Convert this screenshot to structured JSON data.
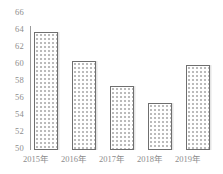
{
  "chart_data": {
    "type": "bar",
    "title": "",
    "subtitle": "",
    "xlabel": "",
    "ylabel": "",
    "categories": [
      "2015年",
      "2016年",
      "2017年",
      "2018年",
      "2019年"
    ],
    "values": [
      63.7,
      60.3,
      57.4,
      55.4,
      59.9
    ],
    "series": [
      {
        "name": "",
        "values": [
          63.7,
          60.3,
          57.4,
          55.4,
          59.9
        ]
      }
    ],
    "ylim": [
      50,
      66
    ],
    "yticks": [
      50,
      52,
      54,
      56,
      58,
      60,
      62,
      64,
      66
    ],
    "ytick_labels": [
      "50",
      "52",
      "54",
      "56",
      "58",
      "60",
      "62",
      "64",
      "66"
    ],
    "grid": false,
    "legend": false,
    "legend_position": "none",
    "bar_fill": "#ffffff",
    "bar_pattern": "dotted",
    "bar_border_color": "#6f6f6f",
    "axis_color": "#9a9a9a",
    "tick_label_color": "#8d8d8d",
    "annotations": []
  }
}
